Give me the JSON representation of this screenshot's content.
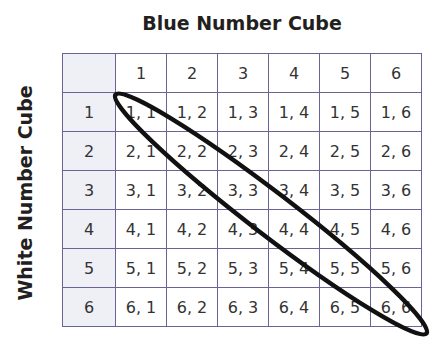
{
  "title_top": "Blue Number Cube",
  "title_side": "White Number Cube",
  "column_headers": [
    "1",
    "2",
    "3",
    "4",
    "5",
    "6"
  ],
  "row_headers": [
    "1",
    "2",
    "3",
    "4",
    "5",
    "6"
  ],
  "cells": [
    [
      "1, 1",
      "1, 2",
      "1, 3",
      "1, 4",
      "1, 5",
      "1, 6"
    ],
    [
      "2, 1",
      "2, 2",
      "2, 3",
      "2, 4",
      "2, 5",
      "2, 6"
    ],
    [
      "3, 1",
      "3, 2",
      "3, 3",
      "3, 4",
      "3, 5",
      "3, 6"
    ],
    [
      "4, 1",
      "4, 2",
      "4, 3",
      "4, 4",
      "4, 5",
      "4, 6"
    ],
    [
      "5, 1",
      "5, 2",
      "5, 3",
      "5, 4",
      "5, 5",
      "5, 6"
    ],
    [
      "6, 1",
      "6, 2",
      "6, 3",
      "6, 4",
      "6, 5",
      "6, 6"
    ]
  ],
  "annotation": {
    "shape": "ellipse",
    "circles": "diagonal doubles 1,1 to 6,6"
  },
  "colors": {
    "grid_line": "#6b6396",
    "header_bg": "#eef0f6",
    "ink": "#231f20"
  }
}
